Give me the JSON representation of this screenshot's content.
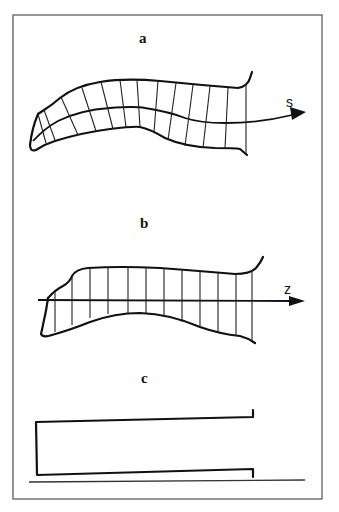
{
  "figure": {
    "panels": [
      {
        "id": "a",
        "label": "a",
        "axis_label": "s",
        "description": "Curved channel with curvilinear grid along centerline s"
      },
      {
        "id": "b",
        "label": "b",
        "axis_label": "z",
        "description": "Straightened channel with vertical cross-sections along axis z"
      },
      {
        "id": "c",
        "label": "c",
        "axis_label": "",
        "description": "Equivalent rectangular channel"
      }
    ],
    "colors": {
      "line": "#111111",
      "frame": "#6a6a6a",
      "background": "#ffffff"
    }
  }
}
